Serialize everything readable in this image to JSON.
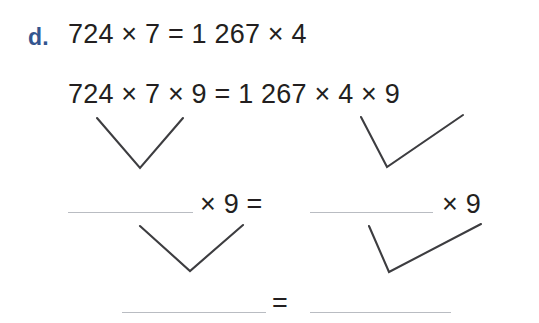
{
  "exercise": {
    "item_label": "d.",
    "lines": [
      {
        "id": "line-1",
        "text": "724 × 7 = 1 267 × 4"
      },
      {
        "id": "line-2",
        "text": "724 × 7 × 9 = 1 267 × 4 × 9"
      },
      {
        "id": "line-3",
        "middle_text": "× 9 =",
        "right_text": "× 9",
        "blank_left": "",
        "blank_right": ""
      },
      {
        "id": "line-4",
        "equals_text": "=",
        "blank_left": "",
        "blank_right": ""
      }
    ]
  },
  "colors": {
    "label_blue": "#33558f",
    "text_black": "#231f20",
    "rule_gray": "#b9bcc2",
    "arrow_gray": "#3d3d40",
    "background": "#ffffff"
  }
}
